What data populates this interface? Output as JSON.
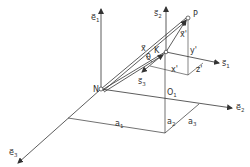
{
  "diagram": {
    "type": "coordinate-frames-3d",
    "labels": {
      "e1": "e⃗",
      "e1_sub": "1",
      "e2": "e⃗",
      "e2_sub": "2",
      "e3": "e⃗",
      "e3_sub": "3",
      "s1": "s⃗",
      "s1_sub": "1",
      "s2": "s⃗",
      "s2_sub": "2",
      "s3": "s⃗",
      "s3_sub": "3",
      "N": "N",
      "P": "P",
      "O1": "O",
      "O1_sub": "1",
      "a1": "a",
      "a1_sub": "1",
      "a2": "a",
      "a2_sub": "2",
      "a3": "a",
      "a3_sub": "3",
      "x": "x⃗",
      "xprime_vec": "x⃗'",
      "K": "K",
      "xprime": "x'",
      "yprime": "y'",
      "zprime": "z'",
      "theta": "θ"
    },
    "colors": {
      "line": "#333333",
      "background": "#ffffff"
    }
  }
}
